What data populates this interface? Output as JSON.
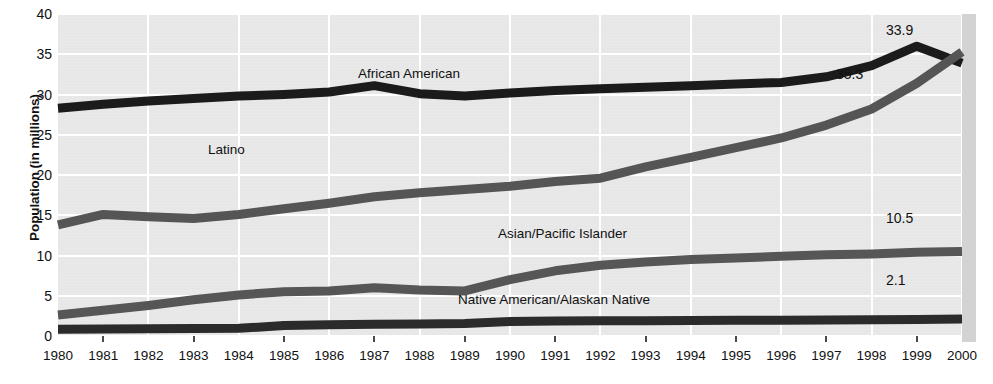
{
  "chart_data": {
    "type": "line",
    "title": "",
    "xlabel": "",
    "ylabel": "Population (in millions)",
    "xlim": [
      1980,
      2000
    ],
    "ylim": [
      0,
      40
    ],
    "grid": true,
    "legend_position": "inline-labels",
    "x": [
      1980,
      1981,
      1982,
      1983,
      1984,
      1985,
      1986,
      1987,
      1988,
      1989,
      1990,
      1991,
      1992,
      1993,
      1994,
      1995,
      1996,
      1997,
      1998,
      1999,
      2000
    ],
    "yticks": [
      0,
      5,
      10,
      15,
      20,
      25,
      30,
      35,
      40
    ],
    "xticks": [
      "1980",
      "1981",
      "1982",
      "1983",
      "1984",
      "1985",
      "1986",
      "1987",
      "1988",
      "1989",
      "1990",
      "1991",
      "1992",
      "1993",
      "1994",
      "1995",
      "1996",
      "1997",
      "1998",
      "1999",
      "2000"
    ],
    "series": [
      {
        "name": "African American",
        "color": "#1b1b1b",
        "label_x": 358,
        "label_y": 66,
        "end_value": "33.9",
        "end_label_x": 886,
        "end_label_y": 22,
        "values": [
          28.3,
          28.8,
          29.2,
          29.5,
          29.8,
          30.0,
          30.3,
          31.1,
          30.1,
          29.8,
          30.2,
          30.5,
          30.7,
          30.9,
          31.1,
          31.3,
          31.5,
          32.2,
          33.6,
          36.0,
          33.9
        ]
      },
      {
        "name": "Latino",
        "color": "#555555",
        "label_x": 208,
        "label_y": 142,
        "end_value": "35.3",
        "end_label_x": 836,
        "end_label_y": 66,
        "values": [
          13.8,
          15.1,
          14.8,
          14.6,
          15.1,
          15.8,
          16.5,
          17.3,
          17.8,
          18.2,
          18.6,
          19.2,
          19.6,
          21.0,
          22.2,
          23.4,
          24.6,
          26.2,
          28.2,
          31.4,
          35.3
        ]
      },
      {
        "name": "Asian/Pacific Islander",
        "color": "#565656",
        "label_x": 498,
        "label_y": 226,
        "end_value": "10.5",
        "end_label_x": 886,
        "end_label_y": 210,
        "values": [
          2.6,
          3.2,
          3.8,
          4.5,
          5.1,
          5.5,
          5.6,
          6.0,
          5.7,
          5.6,
          7.0,
          8.1,
          8.8,
          9.2,
          9.5,
          9.7,
          9.9,
          10.1,
          10.2,
          10.4,
          10.5
        ]
      },
      {
        "name": "Native American/Alaskan Native",
        "color": "#2b2b2b",
        "label_x": 458,
        "label_y": 292,
        "end_value": "2.1",
        "end_label_x": 886,
        "end_label_y": 272,
        "values": [
          0.85,
          0.88,
          0.9,
          0.92,
          0.95,
          1.3,
          1.4,
          1.45,
          1.5,
          1.55,
          1.8,
          1.85,
          1.88,
          1.9,
          1.92,
          1.95,
          1.97,
          2.0,
          2.02,
          2.05,
          2.1
        ]
      }
    ]
  }
}
